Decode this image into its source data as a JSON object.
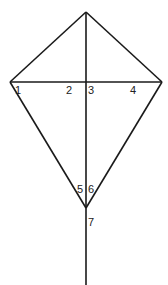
{
  "diagram": {
    "type": "kite-with-diagonals",
    "vertices": {
      "top": [
        86,
        12
      ],
      "left": [
        10,
        82
      ],
      "right": [
        162,
        82
      ],
      "bottom": [
        86,
        208
      ]
    },
    "vertical_line": {
      "from": [
        86,
        12
      ],
      "to": [
        86,
        285
      ]
    },
    "horizontal_line": {
      "from": [
        10,
        82
      ],
      "to": [
        162,
        82
      ]
    },
    "angle_labels": [
      {
        "id": "1",
        "text": "1",
        "x": 15,
        "y": 85
      },
      {
        "id": "2",
        "text": "2",
        "x": 66,
        "y": 85
      },
      {
        "id": "3",
        "text": "3",
        "x": 88,
        "y": 85
      },
      {
        "id": "4",
        "text": "4",
        "x": 130,
        "y": 85
      },
      {
        "id": "5",
        "text": "5",
        "x": 77,
        "y": 184
      },
      {
        "id": "6",
        "text": "6",
        "x": 88,
        "y": 184
      },
      {
        "id": "7",
        "text": "7",
        "x": 88,
        "y": 217
      }
    ],
    "stroke_color": "#1a1a1a"
  }
}
